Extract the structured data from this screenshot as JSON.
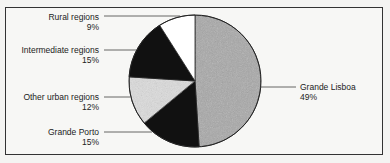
{
  "chart_data": {
    "type": "pie",
    "title": "",
    "categories": [
      "Grande Lisboa",
      "Grande Porto",
      "Other urban regions",
      "Intermediate regions",
      "Rural regions"
    ],
    "values": [
      49,
      15,
      12,
      15,
      9
    ],
    "unit": "%",
    "start_angle": "12 o'clock",
    "direction": "clockwise",
    "slices": [
      {
        "label": "Grande Lisboa",
        "value": 49,
        "value_label": "49%",
        "fill": "#a8a8a8",
        "pattern": "speckled-gray"
      },
      {
        "label": "Grande Porto",
        "value": 15,
        "value_label": "15%",
        "fill": "#111111",
        "pattern": "solid-black"
      },
      {
        "label": "Other urban regions",
        "value": 12,
        "value_label": "12%",
        "fill": "#dcdcdc",
        "pattern": "light-speckle"
      },
      {
        "label": "Intermediate regions",
        "value": 15,
        "value_label": "15%",
        "fill": "#111111",
        "pattern": "solid-black"
      },
      {
        "label": "Rural regions",
        "value": 9,
        "value_label": "9%",
        "fill": "#ffffff",
        "pattern": "white"
      }
    ],
    "legend": "none (callout labels with leader lines)",
    "grid": false
  },
  "labels": {
    "rural": {
      "name": "Rural regions",
      "pct": "9%"
    },
    "intermediate": {
      "name": "Intermediate regions",
      "pct": "15%"
    },
    "other_urban": {
      "name": "Other urban regions",
      "pct": "12%"
    },
    "porto": {
      "name": "Grande Porto",
      "pct": "15%"
    },
    "lisboa": {
      "name": "Grande Lisboa",
      "pct": "49%"
    }
  },
  "colors": {
    "frame": "#333333",
    "background": "#f7f7f5",
    "leader": "#555555",
    "text": "#222222"
  }
}
